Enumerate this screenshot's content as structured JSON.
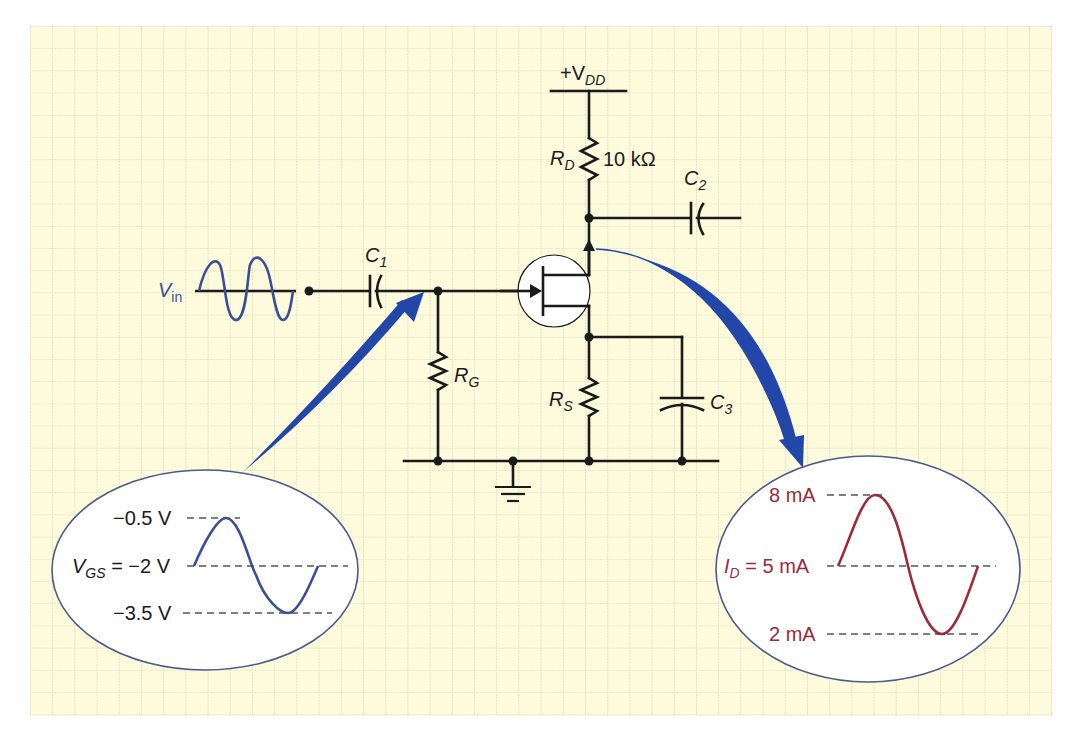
{
  "diagram": {
    "type": "circuit-schematic",
    "colors": {
      "background": "#fdfbdc",
      "grid": "#cfcfbf",
      "wire": "#1a1a1a",
      "input_signal": "#3b4f96",
      "output_signal": "#9b2a3a",
      "arrow": "#2347a8",
      "bubble_fill": "#ffffff",
      "bubble_stroke": "#4a5a8a"
    },
    "labels": {
      "vdd": "+V",
      "vdd_sub": "DD",
      "rd": "R",
      "rd_sub": "D",
      "rd_value": "10 kΩ",
      "c2": "C",
      "c2_sub": "2",
      "c1": "C",
      "c1_sub": "1",
      "vin": "V",
      "vin_sub": "in",
      "rg": "R",
      "rg_sub": "G",
      "rs": "R",
      "rs_sub": "S",
      "c3": "C",
      "c3_sub": "3"
    },
    "input_bubble": {
      "top_label": "−0.5 V",
      "mid_label_prefix": "V",
      "mid_label_sub": "GS",
      "mid_label_value": " = −2 V",
      "bottom_label": "−3.5 V"
    },
    "output_bubble": {
      "top_label": "8 mA",
      "mid_label_prefix": "I",
      "mid_label_sub": "D",
      "mid_label_value": " = 5 mA",
      "bottom_label": "2 mA"
    }
  }
}
